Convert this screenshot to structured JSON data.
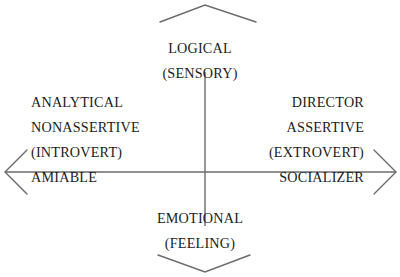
{
  "diagram": {
    "title_visible": false,
    "background_color": "#ffffff",
    "line_color": "#6b6b6b",
    "text_color": "#1c1c1c",
    "axes": {
      "vertical": {
        "name": "logical-emotional-axis",
        "top_pole": "LOGICAL",
        "bottom_pole": "EMOTIONAL"
      },
      "horizontal": {
        "name": "introvert-extrovert-axis",
        "left_pole": "INTROVERT",
        "right_pole": "EXTROVERT"
      }
    },
    "poles": {
      "top": {
        "primary": "LOGICAL",
        "secondary": "(SENSORY)"
      },
      "bottom": {
        "primary": "EMOTIONAL",
        "secondary": "(FEELING)"
      },
      "left": {
        "line1": "ANALYTICAL",
        "line2": "NONASSERTIVE",
        "line3": "(INTROVERT)",
        "line4": "AMIABLE"
      },
      "right": {
        "line1": "DIRECTOR",
        "line2": "ASSERTIVE",
        "line3": "(EXTROVERT)",
        "line4": "SOCIALIZER"
      }
    },
    "arrows": {
      "up": "arrow-up",
      "down": "arrow-down",
      "left": "arrow-left",
      "right": "arrow-right"
    }
  }
}
